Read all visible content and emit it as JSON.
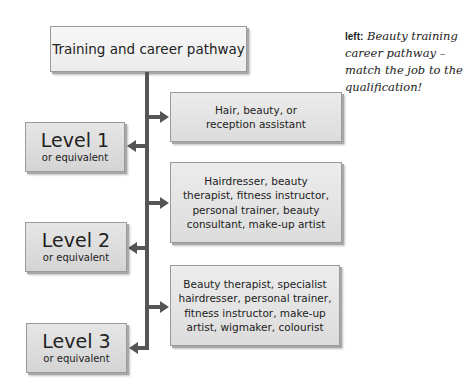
{
  "diagram": {
    "title": "Training and career pathway",
    "levels": [
      {
        "label": "Level 1",
        "sub": "or equivalent"
      },
      {
        "label": "Level 2",
        "sub": "or equivalent"
      },
      {
        "label": "Level 3",
        "sub": "or equivalent"
      }
    ],
    "jobs": [
      {
        "lines": [
          "Hair, beauty, or",
          "reception assistant"
        ]
      },
      {
        "lines": [
          "Hairdresser, beauty",
          "therapist, fitness instructor,",
          "personal trainer, beauty",
          "consultant, make-up artist"
        ]
      },
      {
        "lines": [
          "Beauty therapist, specialist",
          "hairdresser, personal trainer,",
          "fitness instructor, make-up",
          "artist, wigmaker, colourist"
        ]
      }
    ]
  },
  "caption": {
    "lead": "left:",
    "text": "Beauty training career pathway – match the job to the qualification!"
  },
  "colors": {
    "connector": "#555555",
    "box_fill": "#e4e4e4",
    "box_border": "#9a9a9a"
  }
}
